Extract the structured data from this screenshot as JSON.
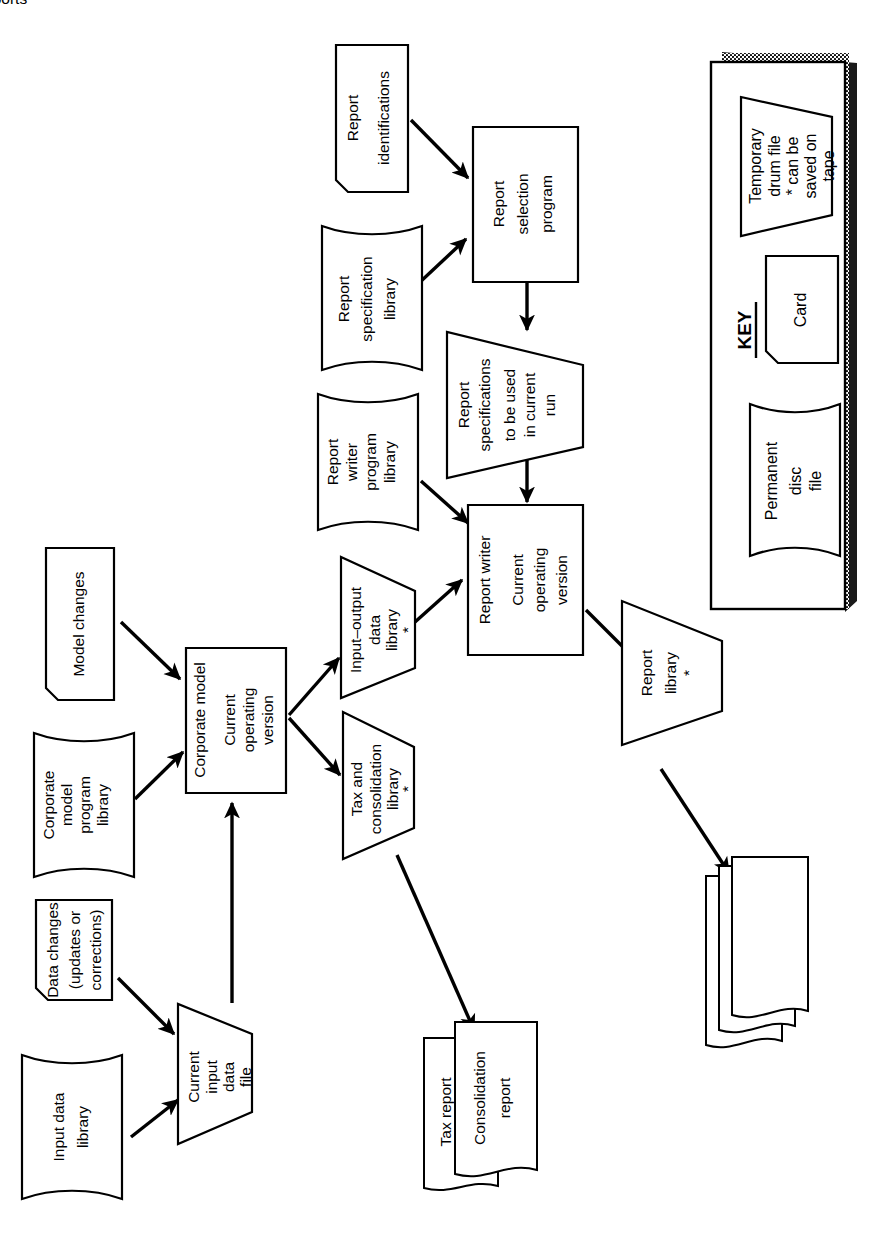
{
  "figure": {
    "orientation": "rotated-90-ccw",
    "kind": "system-flowchart",
    "colors": {
      "ink": "#000000",
      "paper": "#ffffff"
    }
  },
  "nodes": {
    "input_data_library": {
      "label": "Input data\nlibrary",
      "shape": "disc",
      "lines": [
        "Input data",
        "library"
      ]
    },
    "data_changes": {
      "label": "Data changes\n(updates or\ncorrections)",
      "shape": "card",
      "lines": [
        "Data changes",
        "(updates or",
        "corrections)"
      ]
    },
    "current_input_file": {
      "label": "Current\ninput\ndata\nfile",
      "shape": "trapezoid",
      "lines": [
        "Current",
        "input",
        "data",
        "file"
      ]
    },
    "corporate_model_lib": {
      "label": "Corporate\nmodel\nprogram\nlibrary",
      "shape": "disc",
      "lines": [
        "Corporate",
        "model",
        "program",
        "library"
      ]
    },
    "model_changes": {
      "label": "Model changes",
      "shape": "card",
      "lines": [
        "Model changes"
      ]
    },
    "corporate_model": {
      "label": "Corporate model\nCurrent\noperating\nversion",
      "shape": "process",
      "lines": [
        "Corporate model",
        "Current",
        "operating",
        "version"
      ]
    },
    "io_data_library": {
      "label": "Input–output\ndata\nlibrary\n*",
      "shape": "trapezoid",
      "lines": [
        "Input–output",
        "data",
        "library",
        "*"
      ]
    },
    "tax_consol_library": {
      "label": "Tax and\nconsolidation\nlibrary\n*",
      "shape": "trapezoid",
      "lines": [
        "Tax and",
        "consolidation",
        "library",
        "*"
      ]
    },
    "report_identifications": {
      "label": "Report\nidentifications",
      "shape": "card",
      "lines": [
        "Report",
        "identifications"
      ]
    },
    "report_spec_library": {
      "label": "Report\nspecification\nlibrary",
      "shape": "disc",
      "lines": [
        "Report",
        "specification",
        "library"
      ]
    },
    "report_selection_program": {
      "label": "Report\nselection\nprogram",
      "shape": "process",
      "lines": [
        "Report",
        "selection",
        "program"
      ]
    },
    "report_specs_current_run": {
      "label": "Report\nspecifications\nto be used\nin current\nrun",
      "shape": "trapezoid",
      "lines": [
        "Report",
        "specifications",
        "to be used",
        "in current",
        "run"
      ]
    },
    "report_writer_library": {
      "label": "Report\nwriter\nprogram\nlibrary",
      "shape": "disc",
      "lines": [
        "Report",
        "writer",
        "program",
        "library"
      ]
    },
    "report_writer": {
      "label": "Report writer\nCurrent\noperating\nversion",
      "shape": "process",
      "lines": [
        "Report writer",
        "Current",
        "operating",
        "version"
      ]
    },
    "report_library": {
      "label": "Report\nlibrary\n*",
      "shape": "trapezoid",
      "lines": [
        "Report",
        "library",
        "*"
      ]
    },
    "tax_report": {
      "label": "Tax report",
      "shape": "document",
      "lines": [
        "Tax report"
      ]
    },
    "consolidation_report": {
      "label": "Consolidation\nreport",
      "shape": "document",
      "lines": [
        "Consolidation",
        "report"
      ]
    },
    "reports_stack": {
      "label": "Reports",
      "shape": "document-stack",
      "lines": [
        "Reports"
      ]
    }
  },
  "edges": [
    {
      "from": "input_data_library",
      "to": "current_input_file"
    },
    {
      "from": "data_changes",
      "to": "current_input_file"
    },
    {
      "from": "current_input_file",
      "to": "corporate_model"
    },
    {
      "from": "corporate_model_lib",
      "to": "corporate_model"
    },
    {
      "from": "model_changes",
      "to": "corporate_model"
    },
    {
      "from": "corporate_model",
      "to": "io_data_library"
    },
    {
      "from": "corporate_model",
      "to": "tax_consol_library"
    },
    {
      "from": "io_data_library",
      "to": "report_writer"
    },
    {
      "from": "tax_consol_library",
      "to": "consolidation_report"
    },
    {
      "from": "report_identifications",
      "to": "report_selection_program"
    },
    {
      "from": "report_spec_library",
      "to": "report_selection_program"
    },
    {
      "from": "report_selection_program",
      "to": "report_specs_current_run"
    },
    {
      "from": "report_specs_current_run",
      "to": "report_writer"
    },
    {
      "from": "report_writer_library",
      "to": "report_writer"
    },
    {
      "from": "report_writer",
      "to": "report_library"
    },
    {
      "from": "report_library",
      "to": "reports_stack"
    }
  ],
  "key": {
    "title": "KEY",
    "items": [
      {
        "name": "temporary-drum-file",
        "shape": "trapezoid",
        "lines": [
          "Temporary",
          "drum file",
          "* can be",
          "saved on",
          "tape"
        ]
      },
      {
        "name": "card",
        "shape": "card",
        "lines": [
          "Card"
        ]
      },
      {
        "name": "permanent-disc-file",
        "shape": "disc",
        "lines": [
          "Permanent",
          "disc",
          "file"
        ]
      }
    ]
  }
}
